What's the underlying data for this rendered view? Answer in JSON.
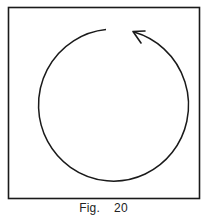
{
  "figure": {
    "caption_prefix": "Fig.",
    "caption_number": "20",
    "colors": {
      "stroke": "#1a1a1a",
      "background": "#ffffff"
    }
  }
}
